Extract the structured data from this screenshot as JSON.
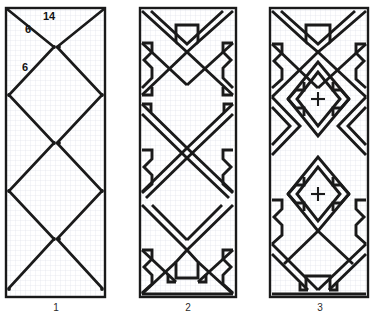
{
  "figure": {
    "background_color": "#ffffff",
    "ink_color": "#1a1a1a",
    "grid_color": "#d9dce6",
    "grid_cell_px": 5
  },
  "panels": [
    {
      "id": "panel-1",
      "caption": "1",
      "x": 6,
      "y": 8,
      "w": 99,
      "h": 289,
      "description": "Graph-paper panel with construction diagonals forming crossed X / lozenge lattice, with vertex dot markers",
      "labels": [
        {
          "name": "dimension-14",
          "text": "14",
          "x": 43,
          "y": 12
        },
        {
          "name": "dimension-6-upper",
          "text": "6",
          "x": 25,
          "y": 24
        },
        {
          "name": "dimension-6-lower",
          "text": "6",
          "x": 22,
          "y": 62
        }
      ],
      "node_rows_y": [
        47,
        95,
        143,
        191,
        239,
        287
      ],
      "crosses": []
    },
    {
      "id": "panel-2",
      "caption": "2",
      "x": 140,
      "y": 8,
      "w": 96,
      "h": 289,
      "description": "Meander ornament: double-outline zigzag bands forming hourglass motifs with hooked terminals",
      "labels": [],
      "crosses": []
    },
    {
      "id": "panel-3",
      "caption": "3",
      "x": 270,
      "y": 8,
      "w": 98,
      "h": 289,
      "description": "Dense meander ornament with nested lozenges; two small cross symbols on the vertical axis",
      "labels": [],
      "crosses": [
        {
          "name": "cross-upper",
          "x": 318,
          "y": 99
        },
        {
          "name": "cross-lower",
          "x": 318,
          "y": 194
        }
      ]
    }
  ],
  "captions": [
    {
      "name": "caption-1",
      "text": "1",
      "x": 55,
      "y": 305
    },
    {
      "name": "caption-2",
      "text": "2",
      "x": 188,
      "y": 305
    },
    {
      "name": "caption-3",
      "text": "3",
      "x": 320,
      "y": 305
    }
  ]
}
